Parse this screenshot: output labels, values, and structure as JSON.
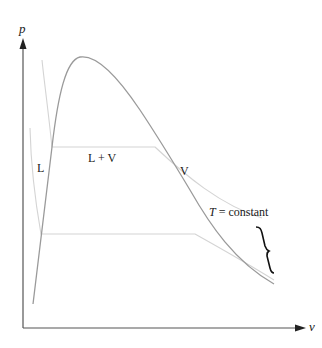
{
  "diagram": {
    "type": "p-v phase diagram",
    "axes": {
      "y_label": "p",
      "x_label": "v"
    },
    "regions": {
      "liquid": "L",
      "two_phase": "L + V",
      "vapor": "V"
    },
    "isotherm_label": {
      "variable": "T",
      "equals": " = constant"
    },
    "colors": {
      "axis": "#555555",
      "dome": "#9a9a9a",
      "isotherm": "#d4d4d4",
      "brace": "#111111",
      "text": "#1a1a1a"
    }
  }
}
